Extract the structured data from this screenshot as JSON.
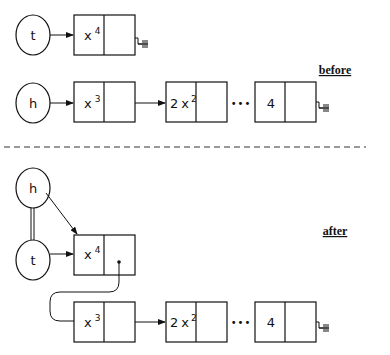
{
  "labels": {
    "before": "before",
    "after": "after"
  },
  "pointers": {
    "tail": "t",
    "head": "h"
  },
  "before": {
    "tail_list": [
      {
        "coef": "",
        "var": "x",
        "exp": "4"
      }
    ],
    "head_list": [
      {
        "coef": "",
        "var": "x",
        "exp": "3"
      },
      {
        "coef": "2",
        "var": "x",
        "exp": "2"
      },
      {
        "ellipsis": "•••"
      },
      {
        "coef": "4",
        "var": "",
        "exp": ""
      }
    ]
  },
  "after": {
    "first_node": {
      "coef": "",
      "var": "x",
      "exp": "4"
    },
    "rest": [
      {
        "coef": "",
        "var": "x",
        "exp": "3"
      },
      {
        "coef": "2",
        "var": "x",
        "exp": "2"
      },
      {
        "ellipsis": "•••"
      },
      {
        "coef": "4",
        "var": "",
        "exp": ""
      }
    ]
  },
  "icons": {
    "null_terminator": "ground-symbol"
  }
}
